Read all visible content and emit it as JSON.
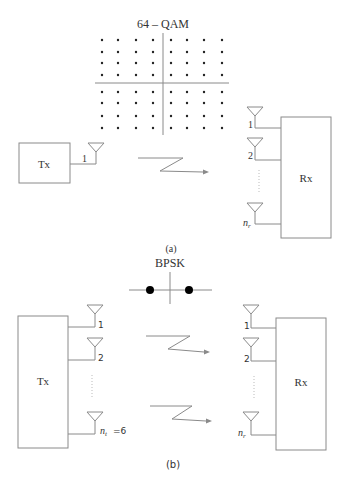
{
  "panel_a": {
    "constellation_title": "64 – QAM",
    "tx_label": "Tx",
    "rx_label": "Rx",
    "tx_antenna_label": "1",
    "rx_antenna_labels": [
      "1",
      "2",
      "n",
      "r"
    ],
    "caption": "(a)"
  },
  "panel_b": {
    "constellation_title": "BPSK",
    "tx_label": "Tx",
    "rx_label": "Rx",
    "tx_antenna_labels": [
      "1",
      "2",
      "n",
      "t",
      "=6"
    ],
    "rx_antenna_labels": [
      "1",
      "2",
      "n",
      "r"
    ],
    "caption": "(b)"
  },
  "colors": {
    "line": "#8a8a8a",
    "constellation_point": "#222222",
    "text": "#333333"
  }
}
